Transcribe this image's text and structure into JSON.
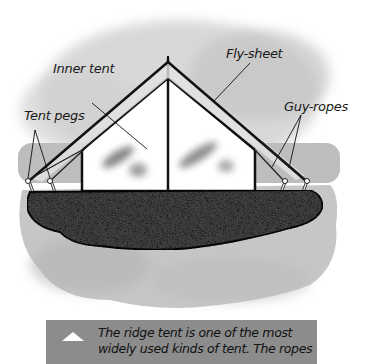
{
  "diagram": {
    "title": "Ridge tent",
    "labels": {
      "fly_sheet": "Fly-sheet",
      "inner_tent": "Inner tent",
      "tent_pegs": "Tent pegs",
      "guy_ropes": "Guy-ropes"
    },
    "colors": {
      "background": "#ffffff",
      "cloud": "#c9c9c9",
      "ground_band": "#b8b8b8",
      "groundsheet": "#3c3c3c",
      "tent_fill": "#ffffff",
      "outline": "#111111",
      "caption_bg": "#8c8c8c",
      "caption_icon": "#ffffff"
    }
  },
  "caption": {
    "icon": "triangle-up-icon",
    "text": "The ridge tent is one of the most widely used kinds of tent. The ropes"
  }
}
